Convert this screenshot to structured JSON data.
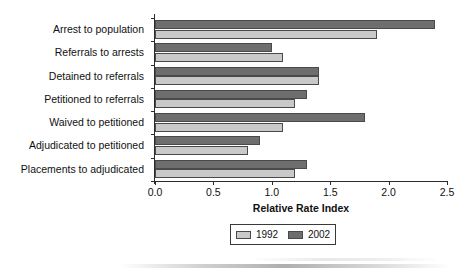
{
  "chart_data": {
    "type": "bar",
    "orientation": "horizontal",
    "title": "",
    "xlabel": "Relative Rate Index",
    "ylabel": "",
    "xlim": [
      0.0,
      2.5
    ],
    "xticks": [
      "0.0",
      "0.5",
      "1.0",
      "1.5",
      "2.0",
      "2.5"
    ],
    "grid": false,
    "legend_position": "bottom",
    "categories": [
      "Arrest to population",
      "Referrals to arrests",
      "Detained to referrals",
      "Petitioned to referrals",
      "Waived to petitioned",
      "Adjudicated to petitioned",
      "Placements to adjudicated"
    ],
    "series": [
      {
        "name": "1992",
        "color": "#c9c9c9",
        "values": [
          1.9,
          1.1,
          1.4,
          1.2,
          1.1,
          0.8,
          1.2
        ]
      },
      {
        "name": "2002",
        "color": "#6e6e6e",
        "values": [
          2.4,
          1.0,
          1.4,
          1.3,
          1.8,
          0.9,
          1.3
        ]
      }
    ]
  },
  "legend": {
    "entries": [
      {
        "label": "1992",
        "color": "#c9c9c9"
      },
      {
        "label": "2002",
        "color": "#6e6e6e"
      }
    ]
  },
  "colors": {
    "series_1992": "#c9c9c9",
    "series_2002": "#6e6e6e",
    "axis": "#2b2b2b",
    "bar_outline": "#4a4a4a",
    "background": "#ffffff"
  }
}
